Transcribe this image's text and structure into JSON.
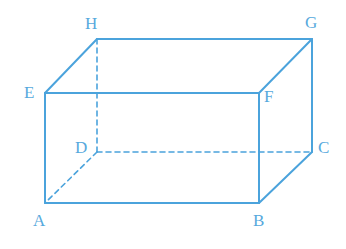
{
  "figure": {
    "kind": "cuboid-wireframe-diagram",
    "background_color": "#ffffff",
    "stroke_color": "#4ba3dc",
    "label_color": "#57a9dd",
    "stroke_width": 2,
    "hidden_stroke_width": 1.6,
    "dash_pattern": "5,4",
    "canvas": {
      "width": 346,
      "height": 249
    }
  },
  "vertices": [
    {
      "id": "A",
      "label": "A",
      "x": 45,
      "y": 203,
      "hidden": false,
      "label_x": 33,
      "label_y": 212
    },
    {
      "id": "B",
      "label": "B",
      "x": 259,
      "y": 203,
      "hidden": false,
      "label_x": 253,
      "label_y": 212
    },
    {
      "id": "C",
      "label": "C",
      "x": 312,
      "y": 152,
      "hidden": false,
      "label_x": 318,
      "label_y": 139
    },
    {
      "id": "D",
      "label": "D",
      "x": 97,
      "y": 152,
      "hidden": true,
      "label_x": 75,
      "label_y": 139
    },
    {
      "id": "E",
      "label": "E",
      "x": 45,
      "y": 93,
      "hidden": false,
      "label_x": 24,
      "label_y": 84
    },
    {
      "id": "F",
      "label": "F",
      "x": 259,
      "y": 93,
      "hidden": false,
      "label_x": 264,
      "label_y": 88
    },
    {
      "id": "G",
      "label": "G",
      "x": 312,
      "y": 39,
      "hidden": false,
      "label_x": 305,
      "label_y": 14
    },
    {
      "id": "H",
      "label": "H",
      "x": 97,
      "y": 39,
      "hidden": false,
      "label_x": 85,
      "label_y": 15
    }
  ],
  "edges": [
    {
      "id": "AB",
      "from": "A",
      "to": "B",
      "style": "solid",
      "name": "edge-a-b"
    },
    {
      "id": "BF",
      "from": "B",
      "to": "F",
      "style": "solid",
      "name": "edge-b-f"
    },
    {
      "id": "FE",
      "from": "F",
      "to": "E",
      "style": "solid",
      "name": "edge-f-e"
    },
    {
      "id": "EA",
      "from": "E",
      "to": "A",
      "style": "solid",
      "name": "edge-e-a"
    },
    {
      "id": "EH",
      "from": "E",
      "to": "H",
      "style": "solid",
      "name": "edge-e-h"
    },
    {
      "id": "HG",
      "from": "H",
      "to": "G",
      "style": "solid",
      "name": "edge-h-g"
    },
    {
      "id": "GF",
      "from": "G",
      "to": "F",
      "style": "solid",
      "name": "edge-g-f"
    },
    {
      "id": "GC",
      "from": "G",
      "to": "C",
      "style": "solid",
      "name": "edge-g-c"
    },
    {
      "id": "CB",
      "from": "C",
      "to": "B",
      "style": "solid",
      "name": "edge-c-b"
    },
    {
      "id": "DH",
      "from": "D",
      "to": "H",
      "style": "dashed",
      "name": "edge-d-h-hidden"
    },
    {
      "id": "DC",
      "from": "D",
      "to": "C",
      "style": "dashed",
      "name": "edge-d-c-hidden"
    },
    {
      "id": "DA",
      "from": "D",
      "to": "A",
      "style": "dashed",
      "name": "edge-d-a-hidden"
    }
  ]
}
